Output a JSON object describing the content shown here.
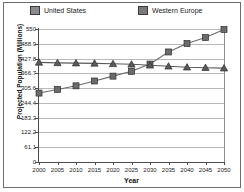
{
  "chart_data": {
    "type": "line",
    "title": "",
    "xlabel": "Year",
    "ylabel": "Projected Population (Millions)",
    "x": [
      2000,
      2005,
      2010,
      2015,
      2020,
      2025,
      2030,
      2035,
      2040,
      2045,
      2050
    ],
    "xtick_labels": [
      "2000",
      "2005",
      "2010",
      "2015",
      "2020",
      "2025",
      "2030",
      "2035",
      "2040",
      "2045",
      "2050"
    ],
    "ytick_labels": [
      "0",
      "61.1",
      "122.2",
      "183.3",
      "244.4",
      "305.6",
      "366.7",
      "427.8",
      "488.9",
      "550"
    ],
    "ytick_values": [
      0,
      61.1,
      122.2,
      183.3,
      244.4,
      305.6,
      366.7,
      427.8,
      488.9,
      550
    ],
    "ylim": [
      0,
      550
    ],
    "xlim": [
      2000,
      2050
    ],
    "grid": true,
    "legend_position": "top",
    "series": [
      {
        "name": "United States",
        "marker": "square",
        "color": "#6b6b6b",
        "values": [
          285,
          300,
          315,
          335,
          355,
          375,
          405,
          455,
          490,
          515,
          548
        ]
      },
      {
        "name": "Western Europe",
        "marker": "triangle",
        "color": "#5a5a5a",
        "values": [
          412,
          410,
          409,
          408,
          406,
          404,
          400,
          396,
          392,
          390,
          388
        ]
      }
    ]
  },
  "legend": {
    "entries": [
      {
        "label": "United States",
        "swatch_color": "#8c8c8c"
      },
      {
        "label": "Western Europe",
        "swatch_color": "#7a7a7a"
      }
    ]
  },
  "axes": {
    "x_title": "Year",
    "y_title": "Projected Population (Millions)"
  },
  "colors": {
    "grid": "#b9b9b9",
    "axis": "#4a4a4a",
    "border": "#6e6e6e",
    "background": "#ffffff",
    "text": "#1a1a1a"
  }
}
